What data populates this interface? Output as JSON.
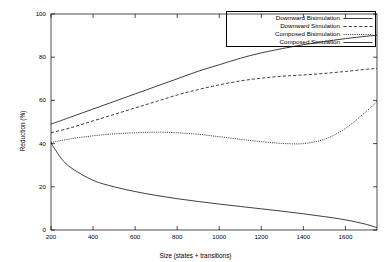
{
  "chart_data": {
    "type": "line",
    "title": "",
    "xlabel": "Size (states + transitions)",
    "ylabel": "Reduction (%)",
    "xlim": [
      200,
      1750
    ],
    "ylim": [
      0,
      100
    ],
    "xticks": [
      200,
      400,
      600,
      800,
      1000,
      1200,
      1400,
      1600
    ],
    "yticks": [
      0,
      20,
      40,
      60,
      80,
      100
    ],
    "grid": false,
    "legend_position": "top-right",
    "series": [
      {
        "name": "Downward Bisimulation",
        "style": "solid",
        "color": "#000000",
        "x": [
          200,
          300,
          400,
          500,
          600,
          700,
          800,
          900,
          1000,
          1100,
          1200,
          1300,
          1400,
          1500,
          1600,
          1700,
          1750
        ],
        "values": [
          49.0,
          52.5,
          56.0,
          59.5,
          63.0,
          66.5,
          70.0,
          73.5,
          76.5,
          79.5,
          82.0,
          84.0,
          85.8,
          87.3,
          88.6,
          89.7,
          90.2
        ]
      },
      {
        "name": "Downward Simulation",
        "style": "dashed",
        "color": "#000000",
        "x": [
          200,
          300,
          400,
          500,
          600,
          700,
          800,
          900,
          1000,
          1100,
          1200,
          1300,
          1400,
          1500,
          1600,
          1700,
          1750
        ],
        "values": [
          45.0,
          47.5,
          50.5,
          53.5,
          56.5,
          59.5,
          62.5,
          65.0,
          67.2,
          69.0,
          70.3,
          71.2,
          71.8,
          72.5,
          73.4,
          74.4,
          74.8
        ]
      },
      {
        "name": "Composed Bisimulation",
        "style": "dotted",
        "color": "#000000",
        "x": [
          200,
          300,
          400,
          500,
          600,
          700,
          800,
          900,
          1000,
          1100,
          1200,
          1300,
          1400,
          1500,
          1600,
          1700,
          1750
        ],
        "values": [
          40.5,
          42.3,
          43.6,
          44.5,
          45.0,
          45.3,
          45.0,
          44.3,
          43.2,
          42.0,
          40.9,
          40.1,
          40.0,
          42.0,
          47.0,
          55.0,
          59.5
        ]
      },
      {
        "name": "Composed Simulation",
        "style": "solid",
        "color": "#000000",
        "x": [
          200,
          250,
          300,
          400,
          500,
          600,
          700,
          800,
          900,
          1000,
          1100,
          1200,
          1300,
          1400,
          1500,
          1600,
          1700,
          1750
        ],
        "values": [
          40.3,
          33.0,
          28.5,
          23.0,
          20.0,
          17.8,
          16.0,
          14.5,
          13.2,
          12.0,
          10.9,
          9.8,
          8.7,
          7.5,
          6.2,
          4.7,
          2.6,
          1.0
        ]
      }
    ]
  },
  "legend": {
    "entries": [
      {
        "label": "Downward Bisimulation",
        "style": "solid"
      },
      {
        "label": "Downward Simulation",
        "style": "dashed"
      },
      {
        "label": "Composed Bisimulation",
        "style": "dotted"
      },
      {
        "label": "Composed Simulation",
        "style": "solid"
      }
    ]
  },
  "axes": {
    "y_title": "Reduction (%)",
    "x_title": "Size (states + transitions)",
    "y_tick_labels": [
      "0",
      "20",
      "40",
      "60",
      "80",
      "100"
    ],
    "x_tick_labels": [
      "200",
      "400",
      "600",
      "800",
      "1000",
      "1200",
      "1400",
      "1600"
    ]
  }
}
